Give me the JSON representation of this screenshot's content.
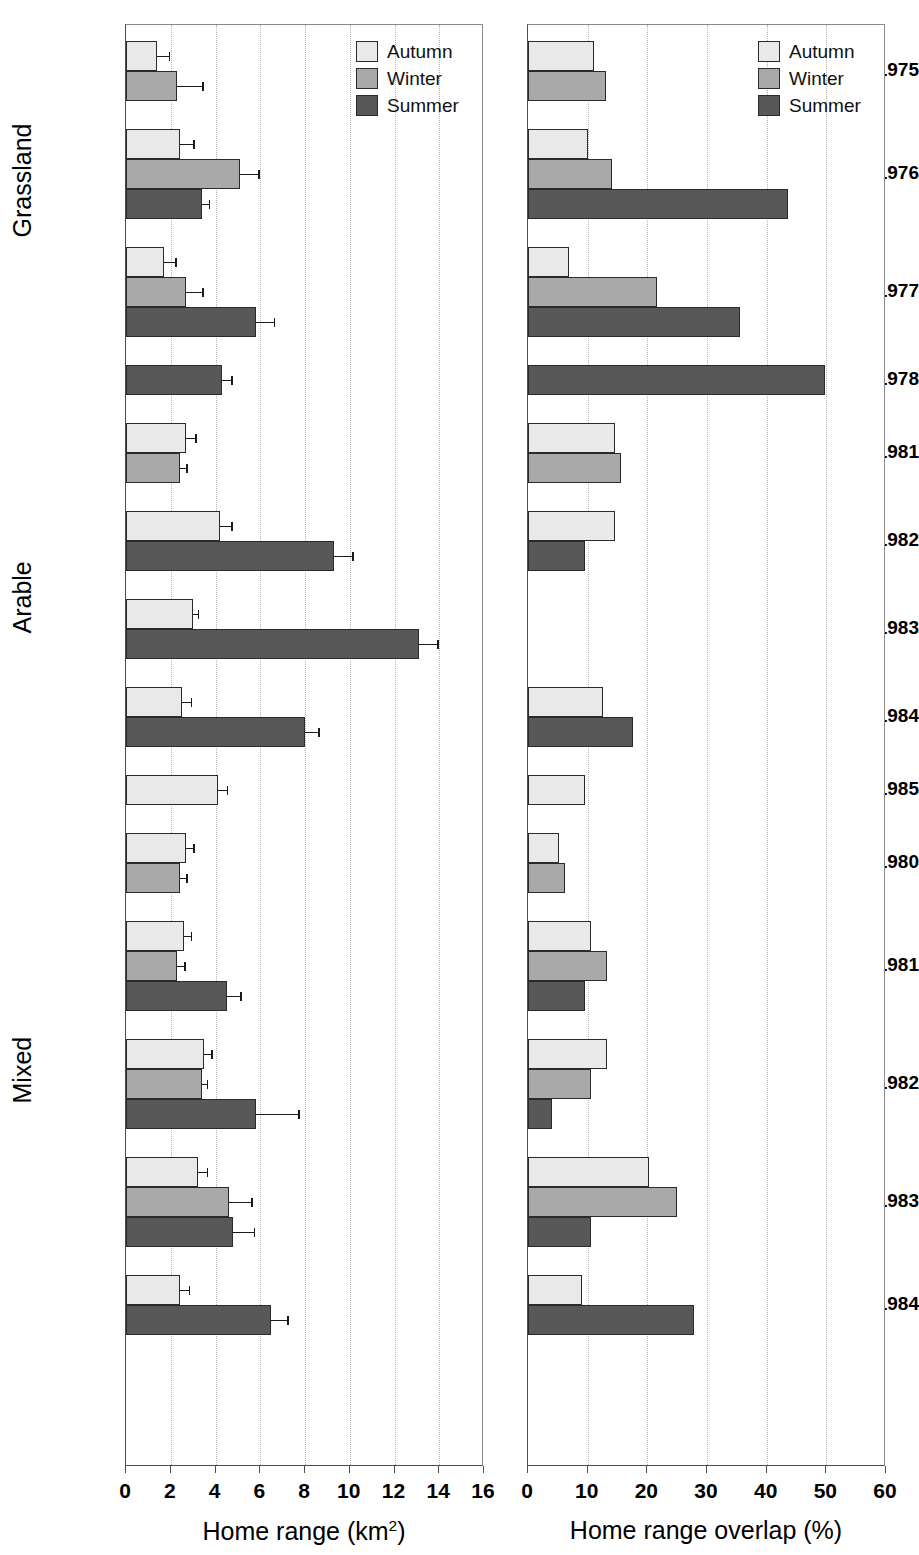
{
  "chart_data": {
    "type": "bar",
    "orientation": "horizontal",
    "title": "",
    "grid": true,
    "legend": {
      "position": "top-right",
      "entries": [
        {
          "label": "Autumn",
          "color": "#e9e9e9"
        },
        {
          "label": "Winter",
          "color": "#a9a9a9"
        },
        {
          "label": "Summer",
          "color": "#585858"
        }
      ]
    },
    "panels": [
      {
        "id": "home-range",
        "xlabel": "Home range (km²)",
        "xlabel_base": "Home range (km",
        "xlabel_sup": "2",
        "xlabel_tail": ")",
        "xlim": [
          0,
          16
        ],
        "xticks": [
          0,
          2,
          4,
          6,
          8,
          10,
          12,
          14,
          16
        ],
        "xticklabels": [
          "0",
          "2",
          "4",
          "6",
          "8",
          "10",
          "12",
          "14",
          "16"
        ]
      },
      {
        "id": "home-range-overlap",
        "xlabel": "Home range overlap  (%)",
        "xlim": [
          0,
          60
        ],
        "xticks": [
          0,
          10,
          20,
          30,
          40,
          50,
          60
        ],
        "xticklabels": [
          "0",
          "10",
          "20",
          "30",
          "40",
          "50",
          "60"
        ]
      }
    ],
    "habitat_groups": [
      {
        "label": "Grassland",
        "years": [
          "1975",
          "1976",
          "1977",
          "1978"
        ]
      },
      {
        "label": "Arable",
        "years": [
          "1981",
          "1982",
          "1983",
          "1984",
          "1985"
        ]
      },
      {
        "label": "Mixed",
        "years": [
          "1980",
          "1981",
          "1982",
          "1983",
          "1984"
        ]
      }
    ],
    "groups": [
      {
        "habitat": "Grassland",
        "year": "1975",
        "home_range": [
          {
            "season": "Autumn",
            "value": 1.4,
            "error": 0.5
          },
          {
            "season": "Winter",
            "value": 2.3,
            "error": 1.1
          }
        ],
        "overlap": [
          {
            "season": "Autumn",
            "value": 11.0
          },
          {
            "season": "Winter",
            "value": 13.0
          }
        ]
      },
      {
        "habitat": "Grassland",
        "year": "1976",
        "home_range": [
          {
            "season": "Autumn",
            "value": 2.4,
            "error": 0.6
          },
          {
            "season": "Winter",
            "value": 5.1,
            "error": 0.8
          },
          {
            "season": "Summer",
            "value": 3.4,
            "error": 0.3
          }
        ],
        "overlap": [
          {
            "season": "Autumn",
            "value": 10.0
          },
          {
            "season": "Winter",
            "value": 14.0
          },
          {
            "season": "Summer",
            "value": 43.5
          }
        ]
      },
      {
        "habitat": "Grassland",
        "year": "1977",
        "home_range": [
          {
            "season": "Autumn",
            "value": 1.7,
            "error": 0.5
          },
          {
            "season": "Winter",
            "value": 2.7,
            "error": 0.7
          },
          {
            "season": "Summer",
            "value": 5.8,
            "error": 0.8
          }
        ],
        "overlap": [
          {
            "season": "Autumn",
            "value": 6.8
          },
          {
            "season": "Winter",
            "value": 21.6
          },
          {
            "season": "Summer",
            "value": 35.6
          }
        ]
      },
      {
        "habitat": "Grassland",
        "year": "1978",
        "home_range": [
          {
            "season": "Summer",
            "value": 4.3,
            "error": 0.4
          }
        ],
        "overlap": [
          {
            "season": "Summer",
            "value": 49.8
          }
        ]
      },
      {
        "habitat": "Arable",
        "year": "1981",
        "home_range": [
          {
            "season": "Autumn",
            "value": 2.7,
            "error": 0.4
          },
          {
            "season": "Winter",
            "value": 2.4,
            "error": 0.3
          }
        ],
        "overlap": [
          {
            "season": "Autumn",
            "value": 14.6
          },
          {
            "season": "Winter",
            "value": 15.6
          }
        ]
      },
      {
        "habitat": "Arable",
        "year": "1982",
        "home_range": [
          {
            "season": "Autumn",
            "value": 4.2,
            "error": 0.5
          },
          {
            "season": "Summer",
            "value": 9.3,
            "error": 0.8
          }
        ],
        "overlap": [
          {
            "season": "Autumn",
            "value": 14.6
          },
          {
            "season": "Summer",
            "value": 9.5
          }
        ]
      },
      {
        "habitat": "Arable",
        "year": "1983",
        "home_range": [
          {
            "season": "Autumn",
            "value": 3.0,
            "error": 0.2
          },
          {
            "season": "Summer",
            "value": 13.1,
            "error": 0.8
          }
        ],
        "overlap": []
      },
      {
        "habitat": "Arable",
        "year": "1984",
        "home_range": [
          {
            "season": "Autumn",
            "value": 2.5,
            "error": 0.4
          },
          {
            "season": "Summer",
            "value": 8.0,
            "error": 0.6
          }
        ],
        "overlap": [
          {
            "season": "Autumn",
            "value": 12.6
          },
          {
            "season": "Summer",
            "value": 17.6
          }
        ]
      },
      {
        "habitat": "Arable",
        "year": "1985",
        "home_range": [
          {
            "season": "Autumn",
            "value": 4.1,
            "error": 0.4
          }
        ],
        "overlap": [
          {
            "season": "Autumn",
            "value": 9.6
          }
        ]
      },
      {
        "habitat": "Mixed",
        "year": "1980",
        "home_range": [
          {
            "season": "Autumn",
            "value": 2.7,
            "error": 0.3
          },
          {
            "season": "Winter",
            "value": 2.4,
            "error": 0.3
          }
        ],
        "overlap": [
          {
            "season": "Autumn",
            "value": 5.2
          },
          {
            "season": "Winter",
            "value": 6.2
          }
        ]
      },
      {
        "habitat": "Mixed",
        "year": "1981",
        "home_range": [
          {
            "season": "Autumn",
            "value": 2.6,
            "error": 0.3
          },
          {
            "season": "Winter",
            "value": 2.3,
            "error": 0.3
          },
          {
            "season": "Summer",
            "value": 4.5,
            "error": 0.6
          }
        ],
        "overlap": [
          {
            "season": "Autumn",
            "value": 10.5
          },
          {
            "season": "Winter",
            "value": 13.3
          },
          {
            "season": "Summer",
            "value": 9.5
          }
        ]
      },
      {
        "habitat": "Mixed",
        "year": "1982",
        "home_range": [
          {
            "season": "Autumn",
            "value": 3.5,
            "error": 0.3
          },
          {
            "season": "Winter",
            "value": 3.4,
            "error": 0.2
          },
          {
            "season": "Summer",
            "value": 5.8,
            "error": 1.9
          }
        ],
        "overlap": [
          {
            "season": "Autumn",
            "value": 13.2
          },
          {
            "season": "Winter",
            "value": 10.5
          },
          {
            "season": "Summer",
            "value": 4.1
          }
        ]
      },
      {
        "habitat": "Mixed",
        "year": "1983",
        "home_range": [
          {
            "season": "Autumn",
            "value": 3.2,
            "error": 0.4
          },
          {
            "season": "Winter",
            "value": 4.6,
            "error": 1.0
          },
          {
            "season": "Summer",
            "value": 4.8,
            "error": 0.9
          }
        ],
        "overlap": [
          {
            "season": "Autumn",
            "value": 20.2
          },
          {
            "season": "Winter",
            "value": 25.0
          },
          {
            "season": "Summer",
            "value": 10.6
          }
        ]
      },
      {
        "habitat": "Mixed",
        "year": "1984",
        "home_range": [
          {
            "season": "Autumn",
            "value": 2.4,
            "error": 0.4
          },
          {
            "season": "Summer",
            "value": 6.5,
            "error": 0.7
          }
        ],
        "overlap": [
          {
            "season": "Autumn",
            "value": 9.0
          },
          {
            "season": "Summer",
            "value": 27.8
          }
        ]
      }
    ]
  }
}
